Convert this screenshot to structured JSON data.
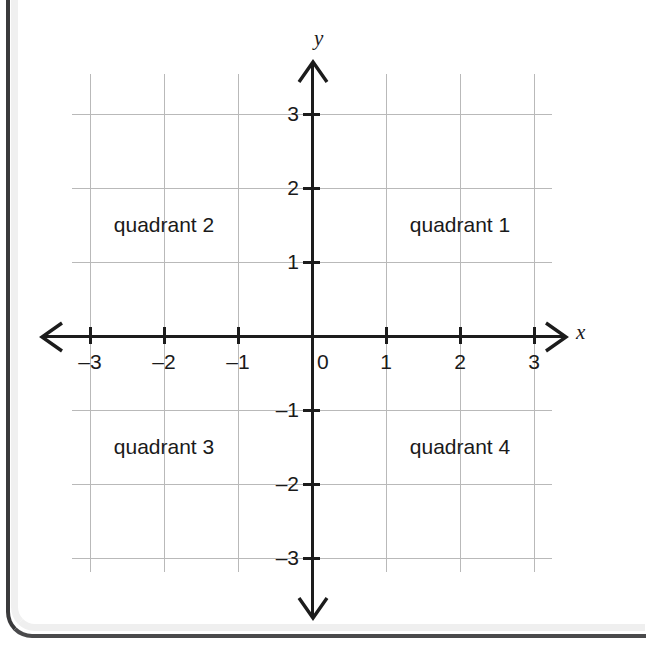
{
  "figure": {
    "kind": "cartesian-coordinate-plane",
    "axis_labels": {
      "x": "x",
      "y": "y"
    },
    "origin_label": "0"
  },
  "chart_data": {
    "type": "scatter",
    "title": "",
    "xlabel": "x",
    "ylabel": "y",
    "xlim": [
      -3.3,
      3.3
    ],
    "ylim": [
      -3.3,
      3.3
    ],
    "grid": true,
    "legend": "none",
    "x_ticks": [
      -3,
      -2,
      -1,
      0,
      1,
      2,
      3
    ],
    "y_ticks": [
      -3,
      -2,
      -1,
      1,
      2,
      3
    ],
    "x_tick_labels": [
      "–3",
      "–2",
      "–1",
      "0",
      "1",
      "2",
      "3"
    ],
    "y_tick_labels": [
      "3",
      "2",
      "1",
      "–1",
      "–2",
      "–3"
    ],
    "series": [],
    "annotations": [
      {
        "text": "quadrant 1",
        "x": 2,
        "y": 1.5
      },
      {
        "text": "quadrant 2",
        "x": -2,
        "y": 1.5
      },
      {
        "text": "quadrant 3",
        "x": -2,
        "y": -1.5
      },
      {
        "text": "quadrant 4",
        "x": 2,
        "y": -1.5
      }
    ]
  },
  "ticks": {
    "x": [
      {
        "value": -3,
        "label": "–3"
      },
      {
        "value": -2,
        "label": "–2"
      },
      {
        "value": -1,
        "label": "–1"
      },
      {
        "value": 1,
        "label": "1"
      },
      {
        "value": 2,
        "label": "2"
      },
      {
        "value": 3,
        "label": "3"
      }
    ],
    "y": [
      {
        "value": 3,
        "label": "3"
      },
      {
        "value": 2,
        "label": "2"
      },
      {
        "value": 1,
        "label": "1"
      },
      {
        "value": -1,
        "label": "–1"
      },
      {
        "value": -2,
        "label": "–2"
      },
      {
        "value": -3,
        "label": "–3"
      }
    ]
  },
  "quadrants": [
    {
      "id": "quadrant-1",
      "label": "quadrant 1"
    },
    {
      "id": "quadrant-2",
      "label": "quadrant 2"
    },
    {
      "id": "quadrant-3",
      "label": "quadrant 3"
    },
    {
      "id": "quadrant-4",
      "label": "quadrant 4"
    }
  ],
  "colors": {
    "axis": "#1c1c1c",
    "grid": "#b9b9b9",
    "text": "#1a1a1a",
    "page_edge": "#3a3a3c",
    "background": "#ffffff"
  }
}
